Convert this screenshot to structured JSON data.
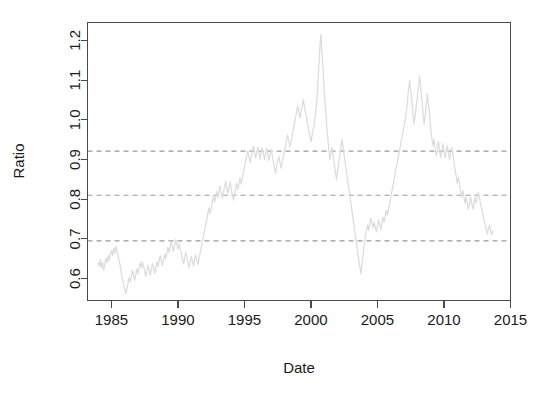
{
  "chart_data": {
    "type": "line",
    "title": "",
    "subtitle": "",
    "xlabel": "Date",
    "ylabel": "Ratio",
    "grid": false,
    "legend": "none",
    "xlim": [
      1983.2,
      2015.0
    ],
    "ylim": [
      0.545,
      1.245
    ],
    "xticks": [
      1985,
      1990,
      1995,
      2000,
      2005,
      2010,
      2015
    ],
    "xticklabels": [
      "1985",
      "1990",
      "1995",
      "2000",
      "2005",
      "2010",
      "2015"
    ],
    "yticks": [
      0.6,
      0.7,
      0.8,
      0.9,
      1.0,
      1.1,
      1.2
    ],
    "yticklabels": [
      "0.6",
      "0.7",
      "0.8",
      "0.9",
      "1.0",
      "1.1",
      "1.2"
    ],
    "series_color": "#dcdcdc",
    "reference_line_color": "#9a9a9a",
    "reference_lines": [
      {
        "label": "upper",
        "value": 0.921,
        "style": "dashed"
      },
      {
        "label": "middle",
        "value": 0.81,
        "style": "dashed"
      },
      {
        "label": "lower",
        "value": 0.695,
        "style": "dashed"
      }
    ],
    "series": [
      {
        "name": "Ratio",
        "color": "#dcdcdc",
        "x": [
          1984.0,
          1984.08,
          1984.17,
          1984.25,
          1984.33,
          1984.42,
          1984.5,
          1984.58,
          1984.67,
          1984.75,
          1984.83,
          1984.92,
          1985.0,
          1985.08,
          1985.17,
          1985.25,
          1985.33,
          1985.42,
          1985.5,
          1985.58,
          1985.67,
          1985.75,
          1985.83,
          1985.92,
          1986.0,
          1986.08,
          1986.17,
          1986.25,
          1986.33,
          1986.42,
          1986.5,
          1986.58,
          1986.67,
          1986.75,
          1986.83,
          1986.92,
          1987.0,
          1987.08,
          1987.17,
          1987.25,
          1987.33,
          1987.42,
          1987.5,
          1987.58,
          1987.67,
          1987.75,
          1987.83,
          1987.92,
          1988.0,
          1988.08,
          1988.17,
          1988.25,
          1988.33,
          1988.42,
          1988.5,
          1988.58,
          1988.67,
          1988.75,
          1988.83,
          1988.92,
          1989.0,
          1989.08,
          1989.17,
          1989.25,
          1989.33,
          1989.42,
          1989.5,
          1989.58,
          1989.67,
          1989.75,
          1989.83,
          1989.92,
          1990.0,
          1990.08,
          1990.17,
          1990.25,
          1990.33,
          1990.42,
          1990.5,
          1990.58,
          1990.67,
          1990.75,
          1990.83,
          1990.92,
          1991.0,
          1991.08,
          1991.17,
          1991.25,
          1991.33,
          1991.42,
          1991.5,
          1991.58,
          1991.67,
          1991.75,
          1991.83,
          1991.92,
          1992.0,
          1992.08,
          1992.17,
          1992.25,
          1992.33,
          1992.42,
          1992.5,
          1992.58,
          1992.67,
          1992.75,
          1992.83,
          1992.92,
          1993.0,
          1993.08,
          1993.17,
          1993.25,
          1993.33,
          1993.42,
          1993.5,
          1993.58,
          1993.67,
          1993.75,
          1993.83,
          1993.92,
          1994.0,
          1994.08,
          1994.17,
          1994.25,
          1994.33,
          1994.42,
          1994.5,
          1994.58,
          1994.67,
          1994.75,
          1994.83,
          1994.92,
          1995.0,
          1995.08,
          1995.17,
          1995.25,
          1995.33,
          1995.42,
          1995.5,
          1995.58,
          1995.67,
          1995.75,
          1995.83,
          1995.92,
          1996.0,
          1996.08,
          1996.17,
          1996.25,
          1996.33,
          1996.42,
          1996.5,
          1996.58,
          1996.67,
          1996.75,
          1996.83,
          1996.92,
          1997.0,
          1997.08,
          1997.17,
          1997.25,
          1997.33,
          1997.42,
          1997.5,
          1997.58,
          1997.67,
          1997.75,
          1997.83,
          1997.92,
          1998.0,
          1998.08,
          1998.17,
          1998.25,
          1998.33,
          1998.42,
          1998.5,
          1998.58,
          1998.67,
          1998.75,
          1998.83,
          1998.92,
          1999.0,
          1999.08,
          1999.17,
          1999.25,
          1999.33,
          1999.42,
          1999.5,
          1999.58,
          1999.67,
          1999.75,
          1999.83,
          1999.92,
          2000.0,
          2000.08,
          2000.17,
          2000.25,
          2000.33,
          2000.42,
          2000.5,
          2000.58,
          2000.67,
          2000.75,
          2000.83,
          2000.92,
          2001.0,
          2001.08,
          2001.17,
          2001.25,
          2001.33,
          2001.42,
          2001.5,
          2001.58,
          2001.67,
          2001.75,
          2001.83,
          2001.92,
          2002.0,
          2002.08,
          2002.17,
          2002.25,
          2002.33,
          2002.42,
          2002.5,
          2002.58,
          2002.67,
          2002.75,
          2002.83,
          2002.92,
          2003.0,
          2003.08,
          2003.17,
          2003.25,
          2003.33,
          2003.42,
          2003.5,
          2003.58,
          2003.67,
          2003.75,
          2003.83,
          2003.92,
          2004.0,
          2004.08,
          2004.17,
          2004.25,
          2004.33,
          2004.42,
          2004.5,
          2004.58,
          2004.67,
          2004.75,
          2004.83,
          2004.92,
          2005.0,
          2005.08,
          2005.17,
          2005.25,
          2005.33,
          2005.42,
          2005.5,
          2005.58,
          2005.67,
          2005.75,
          2005.83,
          2005.92,
          2006.0,
          2006.08,
          2006.17,
          2006.25,
          2006.33,
          2006.42,
          2006.5,
          2006.58,
          2006.67,
          2006.75,
          2006.83,
          2006.92,
          2007.0,
          2007.08,
          2007.17,
          2007.25,
          2007.33,
          2007.42,
          2007.5,
          2007.58,
          2007.67,
          2007.75,
          2007.83,
          2007.92,
          2008.0,
          2008.08,
          2008.17,
          2008.25,
          2008.33,
          2008.42,
          2008.5,
          2008.58,
          2008.67,
          2008.75,
          2008.83,
          2008.92,
          2009.0,
          2009.08,
          2009.17,
          2009.25,
          2009.33,
          2009.42,
          2009.5,
          2009.58,
          2009.67,
          2009.75,
          2009.83,
          2009.92,
          2010.0,
          2010.08,
          2010.17,
          2010.25,
          2010.33,
          2010.42,
          2010.5,
          2010.58,
          2010.67,
          2010.75,
          2010.83,
          2010.92,
          2011.0,
          2011.08,
          2011.17,
          2011.25,
          2011.33,
          2011.42,
          2011.5,
          2011.58,
          2011.67,
          2011.75,
          2011.83,
          2011.92,
          2012.0,
          2012.08,
          2012.17,
          2012.25,
          2012.33,
          2012.42,
          2012.5,
          2012.58,
          2012.67,
          2012.75,
          2012.83,
          2012.92,
          2013.0,
          2013.08,
          2013.17,
          2013.25,
          2013.33,
          2013.42,
          2013.5,
          2013.58,
          2013.67
        ],
        "y": [
          0.64,
          0.632,
          0.648,
          0.627,
          0.641,
          0.622,
          0.636,
          0.652,
          0.64,
          0.658,
          0.645,
          0.663,
          0.67,
          0.658,
          0.676,
          0.664,
          0.681,
          0.669,
          0.657,
          0.645,
          0.63,
          0.612,
          0.598,
          0.585,
          0.572,
          0.562,
          0.575,
          0.59,
          0.603,
          0.592,
          0.607,
          0.621,
          0.609,
          0.596,
          0.611,
          0.625,
          0.612,
          0.628,
          0.64,
          0.627,
          0.642,
          0.63,
          0.618,
          0.605,
          0.62,
          0.634,
          0.622,
          0.609,
          0.624,
          0.638,
          0.626,
          0.613,
          0.628,
          0.642,
          0.63,
          0.645,
          0.658,
          0.646,
          0.633,
          0.648,
          0.662,
          0.65,
          0.665,
          0.679,
          0.666,
          0.681,
          0.694,
          0.682,
          0.669,
          0.684,
          0.698,
          0.686,
          0.673,
          0.688,
          0.676,
          0.663,
          0.65,
          0.637,
          0.652,
          0.666,
          0.654,
          0.641,
          0.628,
          0.643,
          0.657,
          0.645,
          0.632,
          0.646,
          0.66,
          0.648,
          0.635,
          0.65,
          0.664,
          0.678,
          0.692,
          0.706,
          0.72,
          0.735,
          0.75,
          0.765,
          0.779,
          0.764,
          0.778,
          0.793,
          0.807,
          0.792,
          0.806,
          0.82,
          0.805,
          0.819,
          0.833,
          0.818,
          0.803,
          0.817,
          0.831,
          0.845,
          0.83,
          0.815,
          0.829,
          0.843,
          0.828,
          0.813,
          0.798,
          0.812,
          0.826,
          0.84,
          0.825,
          0.839,
          0.853,
          0.838,
          0.852,
          0.866,
          0.88,
          0.894,
          0.908,
          0.922,
          0.907,
          0.892,
          0.906,
          0.92,
          0.934,
          0.919,
          0.904,
          0.918,
          0.932,
          0.917,
          0.902,
          0.916,
          0.93,
          0.915,
          0.9,
          0.914,
          0.928,
          0.913,
          0.898,
          0.912,
          0.926,
          0.911,
          0.896,
          0.881,
          0.866,
          0.88,
          0.894,
          0.908,
          0.893,
          0.878,
          0.892,
          0.906,
          0.92,
          0.934,
          0.948,
          0.962,
          0.947,
          0.932,
          0.946,
          0.96,
          0.975,
          0.99,
          1.005,
          1.02,
          1.035,
          1.02,
          1.005,
          1.02,
          1.035,
          1.05,
          1.035,
          1.02,
          1.005,
          0.99,
          0.975,
          0.96,
          0.945,
          0.96,
          0.975,
          0.99,
          1.01,
          1.04,
          1.08,
          1.13,
          1.18,
          1.215,
          1.17,
          1.12,
          1.07,
          1.03,
          0.99,
          0.96,
          0.93,
          0.9,
          0.915,
          0.93,
          0.91,
          0.89,
          0.87,
          0.85,
          0.87,
          0.89,
          0.91,
          0.93,
          0.95,
          0.93,
          0.91,
          0.89,
          0.87,
          0.85,
          0.83,
          0.81,
          0.79,
          0.77,
          0.75,
          0.73,
          0.71,
          0.69,
          0.67,
          0.65,
          0.63,
          0.612,
          0.635,
          0.66,
          0.685,
          0.705,
          0.72,
          0.735,
          0.722,
          0.738,
          0.752,
          0.74,
          0.728,
          0.742,
          0.73,
          0.718,
          0.732,
          0.748,
          0.736,
          0.724,
          0.74,
          0.755,
          0.742,
          0.758,
          0.772,
          0.76,
          0.775,
          0.79,
          0.805,
          0.82,
          0.835,
          0.85,
          0.865,
          0.88,
          0.895,
          0.91,
          0.925,
          0.94,
          0.955,
          0.97,
          0.985,
          1.0,
          1.02,
          1.045,
          1.075,
          1.1,
          1.075,
          1.045,
          1.015,
          0.99,
          1.01,
          1.035,
          1.06,
          1.085,
          1.11,
          1.085,
          1.055,
          1.02,
          0.99,
          1.01,
          1.04,
          1.065,
          1.04,
          1.01,
          0.98,
          0.955,
          0.935,
          0.95,
          0.93,
          0.91,
          0.925,
          0.945,
          0.925,
          0.905,
          0.92,
          0.94,
          0.925,
          0.905,
          0.92,
          0.935,
          0.918,
          0.9,
          0.915,
          0.93,
          0.912,
          0.893,
          0.875,
          0.858,
          0.84,
          0.855,
          0.838,
          0.82,
          0.805,
          0.822,
          0.805,
          0.79,
          0.805,
          0.79,
          0.775,
          0.79,
          0.805,
          0.79,
          0.775,
          0.79,
          0.805,
          0.79,
          0.805,
          0.818,
          0.803,
          0.788,
          0.775,
          0.762,
          0.75,
          0.738,
          0.725,
          0.712,
          0.723,
          0.735,
          0.722,
          0.71,
          0.72
        ]
      }
    ]
  },
  "labels": {
    "x_axis_title": "Date",
    "y_axis_title": "Ratio"
  }
}
